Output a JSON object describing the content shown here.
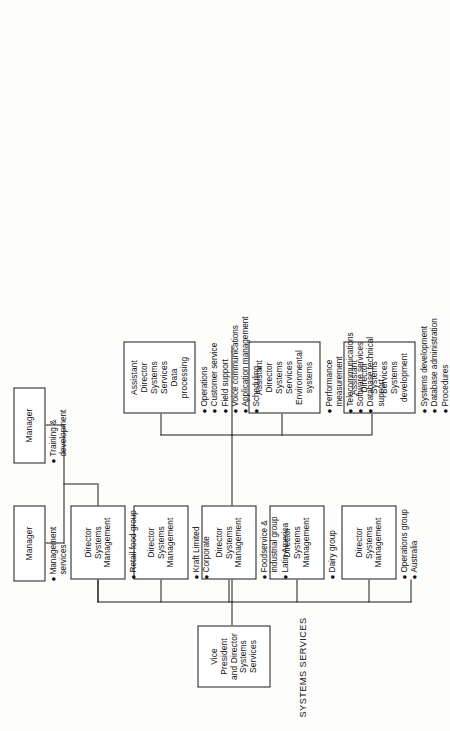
{
  "chart": {
    "title": "SYSTEMS SERVICES",
    "type": "organization-chart",
    "orientation": "rotated-90-ccw",
    "root": {
      "id": "vp",
      "lines": [
        "Vice President",
        "and Director",
        "Systems Services"
      ],
      "label": "Vice President and Director Systems Services"
    },
    "directors": [
      {
        "id": "dir-operations",
        "lines": [
          "Director",
          "Systems",
          "Management"
        ],
        "bullets": [
          "Operations group",
          "Australia"
        ]
      },
      {
        "id": "dir-dairy",
        "lines": [
          "Director",
          "Systems",
          "Management"
        ],
        "bullets": [
          "Dairy group"
        ]
      },
      {
        "id": "dir-foodservice",
        "lines": [
          "Director",
          "Systems",
          "Management"
        ],
        "bullets": [
          "Foodservice &",
          "industrial group",
          "Latin America"
        ],
        "bullet_groups": [
          {
            "dot": true,
            "text": "Foodservice &"
          },
          {
            "dot": false,
            "text": "industrial group"
          },
          {
            "dot": true,
            "text": "Latin America"
          }
        ]
      },
      {
        "id": "dir-kraft",
        "lines": [
          "Director",
          "Systems",
          "Management"
        ],
        "bullets": [
          "Kraft Limited",
          "Corporate"
        ]
      },
      {
        "id": "dir-retail",
        "lines": [
          "Director",
          "Systems",
          "Management"
        ],
        "bullets": [
          "Retail food group"
        ]
      }
    ],
    "assistant_directors": [
      {
        "id": "ad-systems-development",
        "lines": [
          "Assistant",
          "Director",
          "Systems Services",
          "Systems",
          "development"
        ],
        "bullets": [
          "Systems development",
          "Database administration",
          "Procedures"
        ],
        "bullet_groups": [
          {
            "dot": true,
            "text": "Systems development"
          },
          {
            "dot": true,
            "text": "Database administration"
          },
          {
            "dot": true,
            "text": "Procedures"
          }
        ]
      },
      {
        "id": "ad-environmental-systems",
        "lines": [
          "Assistant",
          "Director",
          "Systems Services",
          "Environmental",
          "systems"
        ],
        "bullets": [
          "Performance measurement",
          "Telecommunications",
          "Software services",
          "Database technical support"
        ],
        "bullet_groups": [
          {
            "dot": true,
            "text": "Performance"
          },
          {
            "dot": false,
            "text": "measurement"
          },
          {
            "dot": true,
            "text": "Telecommunications"
          },
          {
            "dot": true,
            "text": "Software services"
          },
          {
            "dot": true,
            "text": "Database technical"
          },
          {
            "dot": false,
            "text": "support"
          }
        ]
      },
      {
        "id": "ad-data-processing",
        "lines": [
          "Assistant",
          "Director",
          "Systems Services",
          "Data",
          "processing"
        ],
        "bullets": [
          "Operations",
          "Customer service",
          "Field support",
          "Voice communications",
          "Application management",
          "Scheduling"
        ],
        "bullet_groups": [
          {
            "dot": true,
            "text": "Operations"
          },
          {
            "dot": true,
            "text": "Customer service"
          },
          {
            "dot": true,
            "text": "Field support"
          },
          {
            "dot": true,
            "text": "Voice communications"
          },
          {
            "dot": true,
            "text": "Application management"
          },
          {
            "dot": true,
            "text": "Scheduling"
          }
        ]
      }
    ],
    "managers": [
      {
        "id": "mgr-management-services",
        "lines": [
          "Manager"
        ],
        "bullets": [
          "Management services"
        ],
        "bullet_groups": [
          {
            "dot": true,
            "text": "Management"
          },
          {
            "dot": false,
            "text": "services"
          }
        ]
      },
      {
        "id": "mgr-training-development",
        "lines": [
          "Manager"
        ],
        "bullets": [
          "Training & development"
        ],
        "bullet_groups": [
          {
            "dot": true,
            "text": "Training &"
          },
          {
            "dot": false,
            "text": "development"
          }
        ]
      }
    ]
  },
  "boxes": {
    "vp": {
      "l1": "Vice President",
      "l2": "and Director",
      "l3": "Systems Services"
    },
    "d1": {
      "l1": "Director",
      "l2": "Systems",
      "l3": "Management"
    },
    "d2": {
      "l1": "Director",
      "l2": "Systems",
      "l3": "Management"
    },
    "d3": {
      "l1": "Director",
      "l2": "Systems",
      "l3": "Management"
    },
    "d4": {
      "l1": "Director",
      "l2": "Systems",
      "l3": "Management"
    },
    "d5": {
      "l1": "Director",
      "l2": "Systems",
      "l3": "Management"
    },
    "a1": {
      "l1": "Assistant",
      "l2": "Director",
      "l3": "Systems Services",
      "l4": "Systems",
      "l5": "development"
    },
    "a2": {
      "l1": "Assistant",
      "l2": "Director",
      "l3": "Systems Services",
      "l4": "Environmental",
      "l5": "systems"
    },
    "a3": {
      "l1": "Assistant",
      "l2": "Director",
      "l3": "Systems Services",
      "l4": "Data",
      "l5": "processing"
    },
    "m1": {
      "l1": "Manager"
    },
    "m2": {
      "l1": "Manager"
    }
  },
  "bullets": {
    "d1": [
      {
        "dot": "●",
        "text": "Operations group"
      },
      {
        "dot": "●",
        "text": "Australia"
      }
    ],
    "d2": [
      {
        "dot": "●",
        "text": "Dairy group"
      }
    ],
    "d3": [
      {
        "dot": "●",
        "text": "Foodservice &"
      },
      {
        "dot": "",
        "text": "industrial group"
      },
      {
        "dot": "●",
        "text": "Latin America"
      }
    ],
    "d4": [
      {
        "dot": "●",
        "text": "Kraft Limited"
      },
      {
        "dot": "●",
        "text": "Corporate"
      }
    ],
    "d5": [
      {
        "dot": "●",
        "text": "Retail food group"
      }
    ],
    "a1": [
      {
        "dot": "●",
        "text": "Systems development"
      },
      {
        "dot": "●",
        "text": "Database administration"
      },
      {
        "dot": "●",
        "text": "Procedures"
      }
    ],
    "a2": [
      {
        "dot": "●",
        "text": "Performance"
      },
      {
        "dot": "",
        "text": "measurement"
      },
      {
        "dot": "●",
        "text": "Telecommunications"
      },
      {
        "dot": "●",
        "text": "Software services"
      },
      {
        "dot": "●",
        "text": "Database technical"
      },
      {
        "dot": "",
        "text": "support"
      }
    ],
    "a3": [
      {
        "dot": "●",
        "text": "Operations"
      },
      {
        "dot": "●",
        "text": "Customer service"
      },
      {
        "dot": "●",
        "text": "Field support"
      },
      {
        "dot": "●",
        "text": "Voice communications"
      },
      {
        "dot": "●",
        "text": "Application management"
      },
      {
        "dot": "●",
        "text": "Scheduling"
      }
    ],
    "m1": [
      {
        "dot": "●",
        "text": "Management"
      },
      {
        "dot": "",
        "text": "services"
      }
    ],
    "m2": [
      {
        "dot": "●",
        "text": "Training &"
      },
      {
        "dot": "",
        "text": "development"
      }
    ]
  },
  "colors": {
    "ink": "#1a1a1a",
    "paper": "#fdfdfb",
    "box_fill": "#ffffff"
  }
}
